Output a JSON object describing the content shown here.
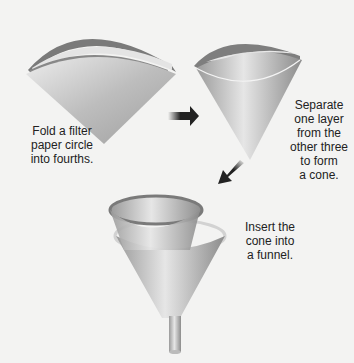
{
  "steps": [
    {
      "id": "fold",
      "text_lines": [
        "Fold a filter",
        "paper circle",
        "into fourths."
      ]
    },
    {
      "id": "separate",
      "text_lines": [
        "Separate",
        "one layer",
        "from the",
        "other three",
        "to form",
        "a cone."
      ]
    },
    {
      "id": "insert",
      "text_lines": [
        "Insert the",
        "cone into",
        "a funnel."
      ]
    }
  ],
  "arrows": [
    {
      "name": "arrow-right-icon",
      "from": "fold",
      "to": "separate"
    },
    {
      "name": "arrow-down-left-icon",
      "from": "separate",
      "to": "insert"
    }
  ],
  "colors": {
    "background": "#f3f3f2",
    "paper": "#c8c8c8",
    "rim": "#8a8a8a",
    "text": "#222222",
    "arrow": "#222222"
  }
}
